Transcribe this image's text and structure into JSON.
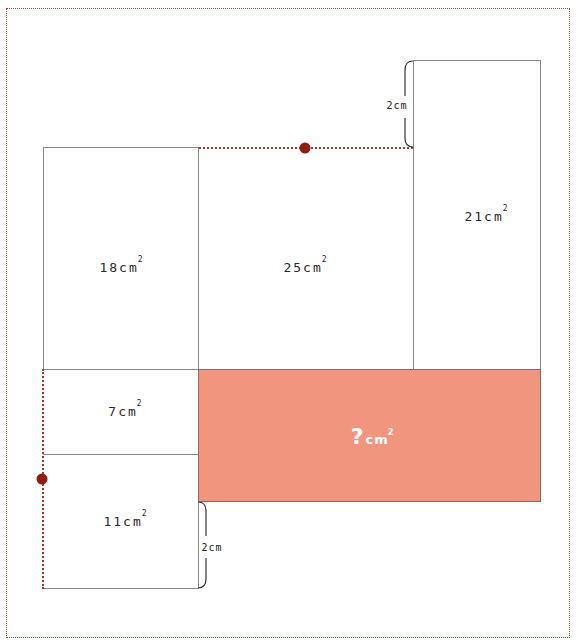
{
  "diagram": {
    "regions": [
      {
        "id": "top-left",
        "value": "18",
        "unit": "cm",
        "exp": "2"
      },
      {
        "id": "top-middle",
        "value": "25",
        "unit": "cm",
        "exp": "2"
      },
      {
        "id": "top-right",
        "value": "21",
        "unit": "cm",
        "exp": "2"
      },
      {
        "id": "mid-left",
        "value": "7",
        "unit": "cm",
        "exp": "2"
      },
      {
        "id": "bottom-left",
        "value": "11",
        "unit": "cm",
        "exp": "2"
      },
      {
        "id": "unknown",
        "value": "?",
        "unit": "cm",
        "exp": "2"
      }
    ],
    "measurements": [
      {
        "id": "top-right-offset",
        "label": "2cm"
      },
      {
        "id": "bottom-left-offset",
        "label": "2cm"
      }
    ],
    "colors": {
      "unknown_fill": "#f2957f",
      "dotted_line": "#a33a2c",
      "marker_dot": "#8e1d12",
      "outline": "#8a8a8a"
    }
  }
}
